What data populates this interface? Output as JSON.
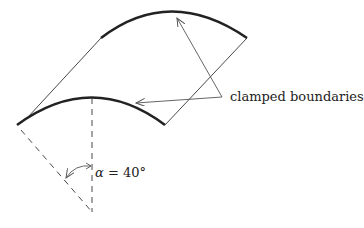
{
  "diagram": {
    "type": "cylindrical shell panel schematic",
    "labels": {
      "boundaries": "clamped boundaries",
      "angle_symbol": "α",
      "angle_eq": " = 40°"
    },
    "angle_deg": 40,
    "colors": {
      "stroke": "#222222",
      "thin_stroke": "#333333",
      "arrow": "#555555",
      "background": "#ffffff"
    }
  }
}
